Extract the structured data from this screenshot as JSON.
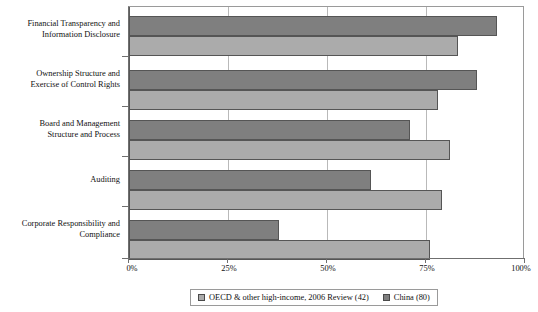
{
  "chart_data": {
    "type": "bar",
    "orientation": "horizontal",
    "title": "",
    "xlabel": "",
    "ylabel": "",
    "xlim": [
      0,
      100
    ],
    "xticks": [
      "0%",
      "25%",
      "50%",
      "75%",
      "100%"
    ],
    "xtick_values": [
      0,
      25,
      50,
      75,
      100
    ],
    "grid": true,
    "legend_position": "bottom",
    "categories": [
      "Financial Transparency and Information Disclosure",
      "Ownership Structure and Exercise of Control Rights",
      "Board and Management Structure and Process",
      "Auditing",
      "Corporate Responsibility and Compliance"
    ],
    "category_lines": [
      [
        "Financial Transparency and",
        "Information Disclosure"
      ],
      [
        "Ownership Structure and",
        "Exercise of Control Rights"
      ],
      [
        "Board and Management",
        "Structure and Process"
      ],
      [
        "Auditing"
      ],
      [
        "Corporate Responsibility and",
        "Compliance"
      ]
    ],
    "series": [
      {
        "name": "China (80)",
        "color": "#7f7f7f",
        "values": [
          93,
          88,
          71,
          61,
          38
        ]
      },
      {
        "name": "OECD & other high-income, 2006 Review (42)",
        "color": "#ababab",
        "values": [
          83,
          78,
          81,
          79,
          76
        ]
      }
    ]
  },
  "legend": {
    "items": [
      {
        "label": "OECD & other high-income, 2006 Review (42)",
        "swatch": "oecd"
      },
      {
        "label": "China (80)",
        "swatch": "china"
      }
    ]
  },
  "axis": {
    "tick_labels": [
      "0%",
      "25%",
      "50%",
      "75%",
      "100%"
    ]
  }
}
